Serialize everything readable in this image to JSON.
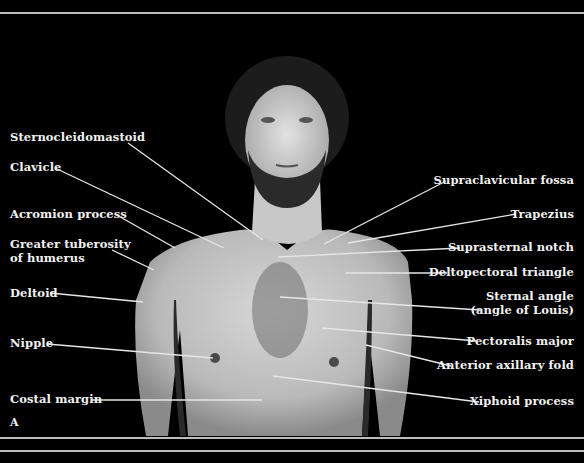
{
  "figure": {
    "panel_letter": "A",
    "colors": {
      "background": "#000000",
      "label_text": "#f2f2f2",
      "leader_line": "#e6e6e6",
      "rule": "#bdbdbd"
    }
  },
  "labels_left": [
    {
      "id": "sternocleidomastoid",
      "text": "Sternocleidomastoid"
    },
    {
      "id": "clavicle",
      "text": "Clavicle"
    },
    {
      "id": "acromion",
      "text": "Acromion process"
    },
    {
      "id": "greater_tuberosity_1",
      "text": "Greater tuberosity"
    },
    {
      "id": "greater_tuberosity_2",
      "text": "of humerus"
    },
    {
      "id": "deltoid",
      "text": "Deltoid"
    },
    {
      "id": "nipple",
      "text": "Nipple"
    },
    {
      "id": "costal_margin",
      "text": "Costal margin"
    }
  ],
  "labels_right": [
    {
      "id": "supraclavicular",
      "text": "Supraclavicular fossa"
    },
    {
      "id": "trapezius",
      "text": "Trapezius"
    },
    {
      "id": "suprasternal",
      "text": "Suprasternal notch"
    },
    {
      "id": "deltopectoral",
      "text": "Deltopectoral triangle"
    },
    {
      "id": "sternal_angle_1",
      "text": "Sternal angle"
    },
    {
      "id": "sternal_angle_2",
      "text": "(angle of Louis)"
    },
    {
      "id": "pectoralis",
      "text": "Pectoralis major"
    },
    {
      "id": "axillary_fold",
      "text": "Anterior axillary fold"
    },
    {
      "id": "xiphoid",
      "text": "Xiphoid process"
    }
  ]
}
